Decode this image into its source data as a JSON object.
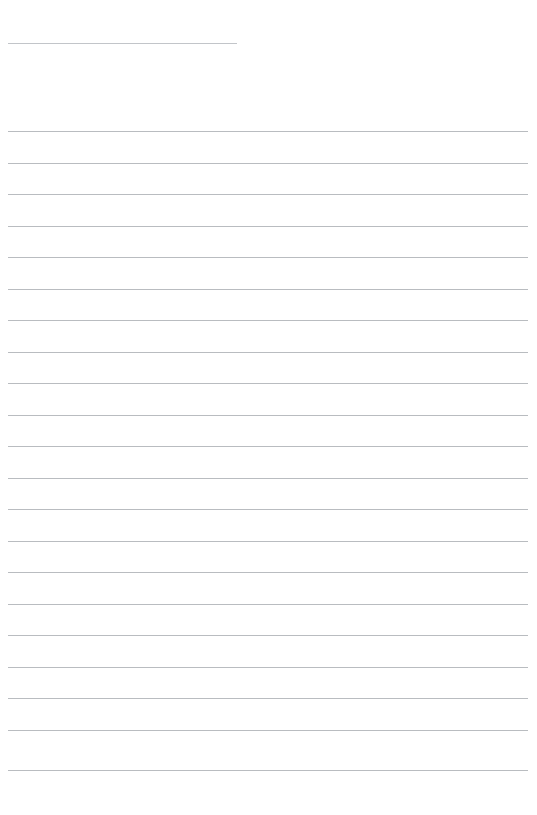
{
  "document": {
    "kind": "lined-writing-template",
    "page_width": 537,
    "page_height": 815,
    "background_color": "#ffffff",
    "rule_color": "#b9bcc0",
    "rule_thickness_px": 1,
    "title_rule": {
      "name": "title-rule",
      "x": 8,
      "y": 43,
      "width": 229,
      "color": "#c2c5c9"
    },
    "body_rules": {
      "left_x": 8,
      "right_x": 528,
      "width": 520,
      "first_y": 131,
      "spacing_px": 31.4,
      "count": 21,
      "y_positions": [
        131,
        163,
        194,
        226,
        257,
        289,
        320,
        352,
        383,
        415,
        446,
        478,
        509,
        541,
        572,
        604,
        635,
        667,
        698,
        730,
        770
      ]
    },
    "text_content": {
      "title_line": "",
      "body_lines": [
        "",
        "",
        "",
        "",
        "",
        "",
        "",
        "",
        "",
        "",
        "",
        "",
        "",
        "",
        "",
        "",
        "",
        "",
        "",
        "",
        ""
      ]
    }
  }
}
